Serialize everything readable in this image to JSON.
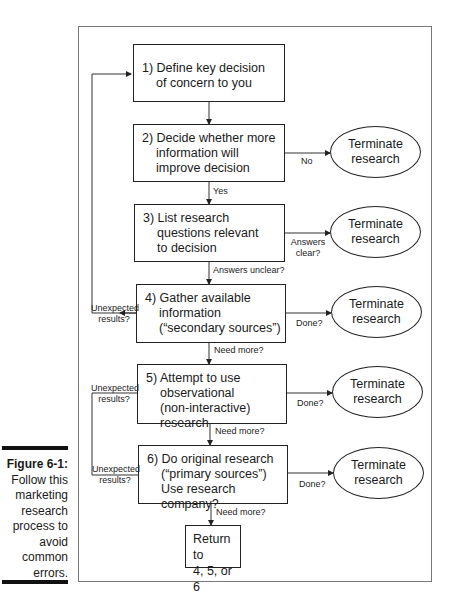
{
  "figure": {
    "number": "Figure 6-1:",
    "caption_lines": [
      "Follow this",
      "marketing",
      "research",
      "process to",
      "avoid",
      "common",
      "errors."
    ]
  },
  "steps": [
    {
      "id": 1,
      "lines": [
        "1) Define key decision",
        "of concern to you"
      ]
    },
    {
      "id": 2,
      "lines": [
        "2) Decide whether more",
        "information will",
        "improve decision"
      ]
    },
    {
      "id": 3,
      "lines": [
        "3) List research",
        "questions relevant",
        "to decision"
      ]
    },
    {
      "id": 4,
      "lines": [
        "4) Gather available",
        "information",
        "(“secondary sources”)"
      ]
    },
    {
      "id": 5,
      "lines": [
        "5) Attempt to use",
        "observational",
        "(non-interactive) research"
      ]
    },
    {
      "id": 6,
      "lines": [
        "6) Do original research",
        "(“primary sources”)",
        "Use research company?"
      ]
    }
  ],
  "return_box": {
    "lines": [
      "Return to",
      "4, 5, or 6"
    ]
  },
  "terminal": {
    "lines": [
      "Terminate",
      "research"
    ]
  },
  "edge_labels": {
    "no": "No",
    "yes": "Yes",
    "answers_clear_1": "Answers",
    "answers_clear_2": "clear?",
    "answers_unclear": "Answers unclear?",
    "done": "Done?",
    "need_more": "Need more?",
    "unexpected_1": "Unexpected",
    "unexpected_2": "results?"
  }
}
